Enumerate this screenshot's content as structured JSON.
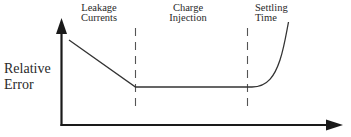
{
  "diagram": {
    "y_axis_label_line1": "Relative",
    "y_axis_label_line2": "Error",
    "regions": [
      {
        "line1": "Leakage",
        "line2": "Currents"
      },
      {
        "line1": "Charge",
        "line2": "Injection"
      },
      {
        "line1": "Settling",
        "line2": "Time"
      }
    ],
    "colors": {
      "axis": "#1a1a1a",
      "curve": "#333333",
      "divider": "#555555",
      "text": "#2a2a2a"
    }
  }
}
